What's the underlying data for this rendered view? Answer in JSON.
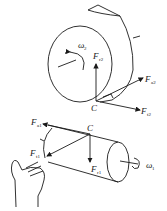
{
  "diagram": {
    "colors": {
      "stroke": "#1a1a1a",
      "background": "#ffffff"
    },
    "gear2": {
      "omega": {
        "sym": "ω",
        "sub": "2"
      },
      "forces": [
        {
          "id": "Fr2",
          "sym": "F",
          "sub": "r2"
        },
        {
          "id": "Fa2",
          "sym": "F",
          "sub": "a2"
        },
        {
          "id": "Ft2",
          "sym": "F",
          "sub": "t2"
        }
      ],
      "contact_point": "C"
    },
    "gear1": {
      "omega": {
        "sym": "ω",
        "sub": "1"
      },
      "forces": [
        {
          "id": "Fa1",
          "sym": "F",
          "sub": "a1"
        },
        {
          "id": "Ft1",
          "sym": "F",
          "sub": "t1"
        },
        {
          "id": "Fr1",
          "sym": "F",
          "sub": "r1"
        }
      ],
      "contact_point": "C",
      "hand_rule": "left-hand rule"
    }
  }
}
